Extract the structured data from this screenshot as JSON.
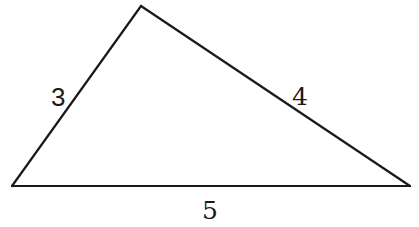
{
  "diagram": {
    "type": "triangle",
    "vertices": {
      "top": {
        "x": 141,
        "y": 6
      },
      "bottom_left": {
        "x": 12,
        "y": 186
      },
      "bottom_right": {
        "x": 410,
        "y": 186
      }
    },
    "sides": [
      {
        "id": "left",
        "from": "bottom_left",
        "to": "top",
        "label": "3"
      },
      {
        "id": "right",
        "from": "top",
        "to": "bottom_right",
        "label": "4"
      },
      {
        "id": "base",
        "from": "bottom_left",
        "to": "bottom_right",
        "label": "5"
      }
    ],
    "line_color": "#1a1a1a",
    "background": "#ffffff"
  }
}
